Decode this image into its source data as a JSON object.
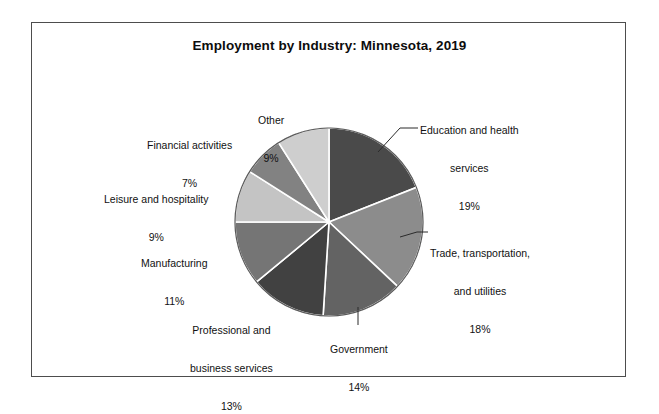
{
  "chart_data": {
    "type": "pie",
    "title": "Employment by Industry: Minnesota, 2019",
    "xlabel": "",
    "ylabel": "",
    "legend_position": "none",
    "grid": false,
    "categories": [
      "Education and health services",
      "Trade, transportation, and utilities",
      "Government",
      "Professional and business services",
      "Manufacturing",
      "Leisure and hospitality",
      "Financial activities",
      "Other"
    ],
    "values": [
      19,
      18,
      14,
      13,
      11,
      9,
      7,
      9
    ],
    "value_labels": [
      "19%",
      "18%",
      "14%",
      "13%",
      "11%",
      "9%",
      "7%",
      "9%"
    ],
    "colors": [
      "#4a4a4a",
      "#8c8c8c",
      "#636363",
      "#414141",
      "#757575",
      "#c4c4c4",
      "#828282",
      "#cecece"
    ],
    "slice_separator_color": "#ffffff",
    "outline_color": "#5a5a5a",
    "background": "#ffffff",
    "start_angle_deg": 0,
    "direction": "clockwise",
    "slices": [
      {
        "label": "Education and health services",
        "value": 19,
        "value_label": "19%",
        "color": "#4a4a4a"
      },
      {
        "label": "Trade, transportation, and utilities",
        "value": 18,
        "value_label": "18%",
        "color": "#8c8c8c"
      },
      {
        "label": "Government",
        "value": 14,
        "value_label": "14%",
        "color": "#636363"
      },
      {
        "label": "Professional and business services",
        "value": 13,
        "value_label": "13%",
        "color": "#414141"
      },
      {
        "label": "Manufacturing",
        "value": 11,
        "value_label": "11%",
        "color": "#757575"
      },
      {
        "label": "Leisure and hospitality",
        "value": 9,
        "value_label": "9%",
        "color": "#c4c4c4"
      },
      {
        "label": "Financial activities",
        "value": 7,
        "value_label": "7%",
        "color": "#828282"
      },
      {
        "label": "Other",
        "value": 9,
        "value_label": "9%",
        "color": "#cecece"
      }
    ]
  },
  "labels": {
    "education": {
      "line1": "Education and health",
      "line2": "services",
      "pct": "19%"
    },
    "trade": {
      "line1": "Trade, transportation,",
      "line2": "and utilities",
      "pct": "18%"
    },
    "government": {
      "line1": "Government",
      "pct": "14%"
    },
    "professional": {
      "line1": "Professional and",
      "line2": "business services",
      "pct": "13%"
    },
    "manufacturing": {
      "line1": "Manufacturing",
      "pct": "11%"
    },
    "leisure": {
      "line1": "Leisure and hospitality",
      "pct": "9%"
    },
    "financial": {
      "line1": "Financial activities",
      "pct": "7%"
    },
    "other": {
      "line1": "Other",
      "pct": "9%"
    }
  },
  "frame": {
    "border_color": "#4d4d4d",
    "background": "#ffffff"
  }
}
